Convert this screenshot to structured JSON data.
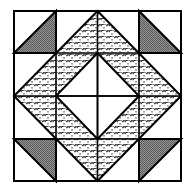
{
  "diagram": {
    "title": "Quilt block pattern",
    "grid": {
      "rows": 4,
      "cols": 4
    },
    "colors": {
      "background": "#ffffff",
      "stroke": "#000000",
      "corner_fill": "#7f7f7f",
      "scale_fill": "#ffffff",
      "scale_stroke": "#000000"
    },
    "elements": {
      "outer_square": "outer-square",
      "scale_band": "diamond-band-fish-scale",
      "inner_diamond": "inner-diamond-white",
      "center_cross": "center-cross-lines",
      "corner_triangles": [
        "top-left",
        "top-right",
        "bottom-left",
        "bottom-right"
      ]
    }
  }
}
